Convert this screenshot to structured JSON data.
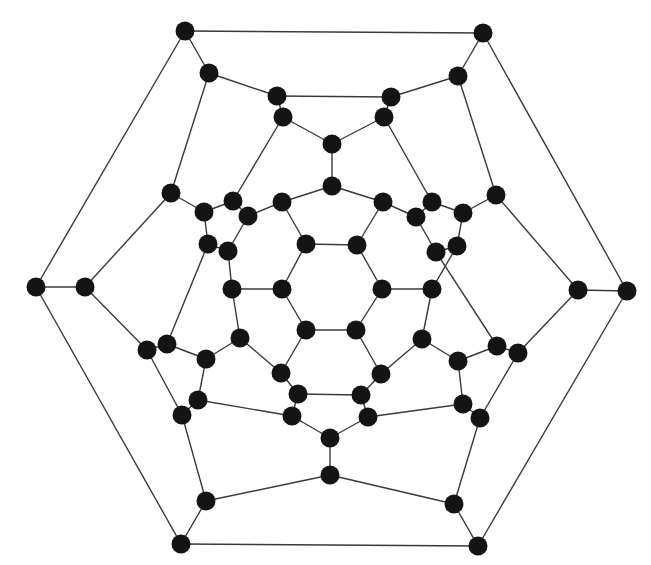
{
  "diagram": {
    "type": "graph",
    "style": {
      "node_color": "#141414",
      "edge_color": "#3a3a3a",
      "node_radius": 9.5,
      "background": "#ffffff"
    },
    "nodes": [
      {
        "id": "A0",
        "x": 185,
        "y": 31
      },
      {
        "id": "A1",
        "x": 483,
        "y": 33
      },
      {
        "id": "A2",
        "x": 627,
        "y": 291
      },
      {
        "id": "A3",
        "x": 478,
        "y": 546
      },
      {
        "id": "A4",
        "x": 181,
        "y": 544
      },
      {
        "id": "A5",
        "x": 36,
        "y": 287
      },
      {
        "id": "B0",
        "x": 209,
        "y": 73
      },
      {
        "id": "B1",
        "x": 458,
        "y": 76
      },
      {
        "id": "B2",
        "x": 578,
        "y": 290
      },
      {
        "id": "B3",
        "x": 454,
        "y": 504
      },
      {
        "id": "B4",
        "x": 206,
        "y": 501
      },
      {
        "id": "B5",
        "x": 85,
        "y": 287
      },
      {
        "id": "C0",
        "x": 277,
        "y": 96
      },
      {
        "id": "C1",
        "x": 391,
        "y": 97
      },
      {
        "id": "C2",
        "x": 283,
        "y": 117
      },
      {
        "id": "C3",
        "x": 384,
        "y": 117
      },
      {
        "id": "D0",
        "x": 332,
        "y": 144
      },
      {
        "id": "D1",
        "x": 332,
        "y": 186
      },
      {
        "id": "E0",
        "x": 171,
        "y": 193
      },
      {
        "id": "E1",
        "x": 496,
        "y": 195
      },
      {
        "id": "F0",
        "x": 204,
        "y": 212
      },
      {
        "id": "F1",
        "x": 233,
        "y": 201
      },
      {
        "id": "F2",
        "x": 248,
        "y": 216
      },
      {
        "id": "F3",
        "x": 282,
        "y": 202
      },
      {
        "id": "G0",
        "x": 383,
        "y": 202
      },
      {
        "id": "G1",
        "x": 432,
        "y": 202
      },
      {
        "id": "G2",
        "x": 416,
        "y": 217
      },
      {
        "id": "G3",
        "x": 463,
        "y": 213
      },
      {
        "id": "H0",
        "x": 208,
        "y": 244
      },
      {
        "id": "H1",
        "x": 228,
        "y": 251
      },
      {
        "id": "H2",
        "x": 306,
        "y": 244
      },
      {
        "id": "H3",
        "x": 357,
        "y": 245
      },
      {
        "id": "H4",
        "x": 436,
        "y": 252
      },
      {
        "id": "H5",
        "x": 457,
        "y": 246
      },
      {
        "id": "I0",
        "x": 232,
        "y": 289
      },
      {
        "id": "I1",
        "x": 282,
        "y": 289
      },
      {
        "id": "I2",
        "x": 382,
        "y": 289
      },
      {
        "id": "I3",
        "x": 432,
        "y": 289
      },
      {
        "id": "J0",
        "x": 147,
        "y": 350
      },
      {
        "id": "J1",
        "x": 167,
        "y": 344
      },
      {
        "id": "J2",
        "x": 206,
        "y": 359
      },
      {
        "id": "J3",
        "x": 240,
        "y": 338
      },
      {
        "id": "J4",
        "x": 306,
        "y": 330
      },
      {
        "id": "J5",
        "x": 356,
        "y": 330
      },
      {
        "id": "J6",
        "x": 422,
        "y": 339
      },
      {
        "id": "J7",
        "x": 458,
        "y": 361
      },
      {
        "id": "J8",
        "x": 497,
        "y": 346
      },
      {
        "id": "J9",
        "x": 518,
        "y": 353
      },
      {
        "id": "K0",
        "x": 281,
        "y": 373
      },
      {
        "id": "K1",
        "x": 381,
        "y": 374
      },
      {
        "id": "K2",
        "x": 298,
        "y": 394
      },
      {
        "id": "K3",
        "x": 361,
        "y": 395
      },
      {
        "id": "K4",
        "x": 198,
        "y": 400
      },
      {
        "id": "K5",
        "x": 463,
        "y": 404
      },
      {
        "id": "L0",
        "x": 182,
        "y": 415
      },
      {
        "id": "L1",
        "x": 292,
        "y": 416
      },
      {
        "id": "L2",
        "x": 368,
        "y": 417
      },
      {
        "id": "L3",
        "x": 480,
        "y": 418
      },
      {
        "id": "M0",
        "x": 330,
        "y": 438
      },
      {
        "id": "M1",
        "x": 330,
        "y": 475
      }
    ],
    "edges": [
      [
        "A0",
        "A1"
      ],
      [
        "A1",
        "A2"
      ],
      [
        "A2",
        "A3"
      ],
      [
        "A3",
        "A4"
      ],
      [
        "A4",
        "A5"
      ],
      [
        "A5",
        "A0"
      ],
      [
        "A0",
        "B0"
      ],
      [
        "A1",
        "B1"
      ],
      [
        "A2",
        "B2"
      ],
      [
        "A3",
        "B3"
      ],
      [
        "A4",
        "B4"
      ],
      [
        "A5",
        "B5"
      ],
      [
        "B0",
        "C0"
      ],
      [
        "C0",
        "C1"
      ],
      [
        "C1",
        "B1"
      ],
      [
        "B0",
        "E0"
      ],
      [
        "B1",
        "E1"
      ],
      [
        "C0",
        "C2"
      ],
      [
        "C1",
        "C3"
      ],
      [
        "C2",
        "D0"
      ],
      [
        "C3",
        "D0"
      ],
      [
        "D0",
        "D1"
      ],
      [
        "C2",
        "F1"
      ],
      [
        "C3",
        "G1"
      ],
      [
        "D1",
        "F3"
      ],
      [
        "D1",
        "G0"
      ],
      [
        "E0",
        "F0"
      ],
      [
        "E0",
        "B5"
      ],
      [
        "E1",
        "B2"
      ],
      [
        "E1",
        "G3"
      ],
      [
        "F0",
        "F1"
      ],
      [
        "F1",
        "F2"
      ],
      [
        "F2",
        "F3"
      ],
      [
        "F0",
        "H0"
      ],
      [
        "F2",
        "H1"
      ],
      [
        "F3",
        "H2"
      ],
      [
        "G0",
        "G2"
      ],
      [
        "G2",
        "G1"
      ],
      [
        "G1",
        "G3"
      ],
      [
        "G2",
        "H4"
      ],
      [
        "G3",
        "H5"
      ],
      [
        "G0",
        "H3"
      ],
      [
        "H0",
        "H1"
      ],
      [
        "H0",
        "J1"
      ],
      [
        "H1",
        "I0"
      ],
      [
        "H2",
        "H3"
      ],
      [
        "H3",
        "I2"
      ],
      [
        "I2",
        "J5"
      ],
      [
        "J5",
        "J4"
      ],
      [
        "J4",
        "I1"
      ],
      [
        "I1",
        "H2"
      ],
      [
        "H4",
        "H5"
      ],
      [
        "H4",
        "J8"
      ],
      [
        "H5",
        "I3"
      ],
      [
        "I0",
        "I1"
      ],
      [
        "I0",
        "J3"
      ],
      [
        "I2",
        "I3"
      ],
      [
        "I3",
        "J6"
      ],
      [
        "J0",
        "J1"
      ],
      [
        "J0",
        "B5"
      ],
      [
        "J0",
        "L0"
      ],
      [
        "J1",
        "J2"
      ],
      [
        "J2",
        "J3"
      ],
      [
        "J2",
        "K4"
      ],
      [
        "J3",
        "K0"
      ],
      [
        "J4",
        "K0"
      ],
      [
        "K0",
        "K2"
      ],
      [
        "K2",
        "K3"
      ],
      [
        "K2",
        "L1"
      ],
      [
        "K4",
        "L1"
      ],
      [
        "K4",
        "L0"
      ],
      [
        "L0",
        "B4"
      ],
      [
        "J5",
        "K1"
      ],
      [
        "K1",
        "J6"
      ],
      [
        "K1",
        "K3"
      ],
      [
        "K3",
        "L2"
      ],
      [
        "J6",
        "J7"
      ],
      [
        "J7",
        "J8"
      ],
      [
        "J7",
        "K5"
      ],
      [
        "J8",
        "J9"
      ],
      [
        "J9",
        "B2"
      ],
      [
        "J9",
        "L3"
      ],
      [
        "K5",
        "L3"
      ],
      [
        "K5",
        "L2"
      ],
      [
        "L3",
        "B3"
      ],
      [
        "L1",
        "M0"
      ],
      [
        "L2",
        "M0"
      ],
      [
        "M0",
        "M1"
      ],
      [
        "M1",
        "B4"
      ],
      [
        "M1",
        "B3"
      ]
    ]
  }
}
